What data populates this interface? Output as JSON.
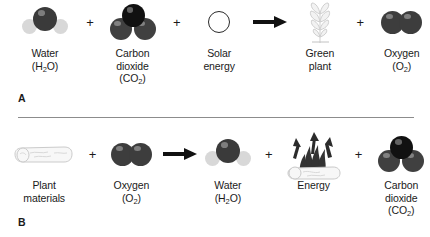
{
  "diagram": {
    "panels": [
      {
        "label": "A",
        "name": "photosynthesis",
        "terms": [
          {
            "name": "water",
            "icon": "water-molecule-icon",
            "line1": "Water",
            "line2": "(H2O)",
            "sub": "2",
            "pre": "(H",
            "post": "O)"
          },
          {
            "name": "operator-plus",
            "icon": "plus-operator",
            "symbol": "+"
          },
          {
            "name": "carbon-dioxide",
            "icon": "carbon-dioxide-molecule-icon",
            "line1": "Carbon",
            "line1b": "dioxide",
            "line2": "(CO2)",
            "sub": "2",
            "pre": "(CO",
            "post": ")"
          },
          {
            "name": "operator-plus",
            "icon": "plus-operator",
            "symbol": "+"
          },
          {
            "name": "solar-energy",
            "icon": "sun-circle-icon",
            "line1": "Solar",
            "line1b": "energy"
          },
          {
            "name": "operator-arrow",
            "icon": "right-arrow-icon",
            "symbol": "→"
          },
          {
            "name": "green-plant",
            "icon": "green-plant-icon",
            "line1": "Green",
            "line1b": "plant"
          },
          {
            "name": "operator-plus",
            "icon": "plus-operator",
            "symbol": "+"
          },
          {
            "name": "oxygen",
            "icon": "oxygen-molecule-icon",
            "line1": "Oxygen",
            "line2": "(O2)",
            "sub": "2",
            "pre": "(O",
            "post": ")"
          }
        ]
      },
      {
        "label": "B",
        "name": "respiration",
        "terms": [
          {
            "name": "plant-materials",
            "icon": "log-icon",
            "line1": "Plant",
            "line1b": "materials"
          },
          {
            "name": "operator-plus",
            "icon": "plus-operator",
            "symbol": "+"
          },
          {
            "name": "oxygen",
            "icon": "oxygen-molecule-icon",
            "line1": "Oxygen",
            "line2": "(O2)",
            "sub": "2",
            "pre": "(O",
            "post": ")"
          },
          {
            "name": "operator-arrow",
            "icon": "right-arrow-icon",
            "symbol": "→"
          },
          {
            "name": "water",
            "icon": "water-molecule-icon",
            "line1": "Water",
            "line2": "(H2O)",
            "sub": "2",
            "pre": "(H",
            "post": "O)"
          },
          {
            "name": "operator-plus",
            "icon": "plus-operator",
            "symbol": "+"
          },
          {
            "name": "energy",
            "icon": "burning-log-flame-icon",
            "line1": "Energy"
          },
          {
            "name": "operator-plus",
            "icon": "plus-operator",
            "symbol": "+"
          },
          {
            "name": "carbon-dioxide",
            "icon": "carbon-dioxide-molecule-icon",
            "line1": "Carbon",
            "line1b": "dioxide",
            "line2": "(CO2)",
            "sub": "2",
            "pre": "(CO",
            "post": ")"
          }
        ]
      }
    ],
    "colors": {
      "carbon": "#111111",
      "oxygen_atom": "#3d3d3d",
      "hydrogen_atom": "#d8d8d8",
      "sketch_outline": "#c9c9c9",
      "flame": "#2e2e2e",
      "text": "#1a1a1a",
      "divider": "#8c8c8c",
      "background": "#ffffff"
    }
  }
}
